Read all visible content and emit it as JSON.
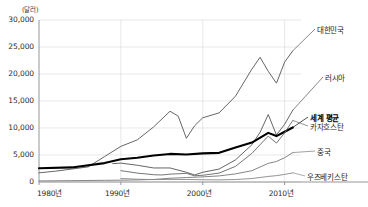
{
  "chart_data": {
    "type": "line",
    "title": "",
    "subtitle": "",
    "unit_label": "(달러)",
    "xlabel": "",
    "ylabel": "",
    "xlim": [
      1980,
      2012
    ],
    "ylim": [
      0,
      30000
    ],
    "grid": true,
    "legend_position": "right-inline",
    "x_ticks": [
      "1980년",
      "1990년",
      "2000년",
      "2010년"
    ],
    "x_tick_values": [
      1980,
      1990,
      2000,
      2010
    ],
    "y_ticks": [
      "0",
      "5,000",
      "10,000",
      "15,000",
      "20,000",
      "25,000",
      "30,000"
    ],
    "y_tick_values": [
      0,
      5000,
      10000,
      15000,
      20000,
      25000,
      30000
    ],
    "series": [
      {
        "name": "대한민국",
        "label": "대한민국",
        "emphasis": false,
        "color": "#555555",
        "width": 0.9,
        "x": [
          1980,
          1982,
          1984,
          1986,
          1988,
          1990,
          1992,
          1994,
          1996,
          1997,
          1998,
          1999,
          2000,
          2002,
          2004,
          2006,
          2007,
          2008,
          2009,
          2010,
          2011
        ],
        "values": [
          1700,
          2000,
          2400,
          2800,
          4700,
          6600,
          7800,
          10200,
          13100,
          12200,
          8100,
          10400,
          11900,
          12800,
          15900,
          20900,
          23100,
          20500,
          18300,
          22200,
          24300
        ]
      },
      {
        "name": "러시아",
        "label": "러시아",
        "emphasis": false,
        "color": "#555555",
        "width": 0.9,
        "x": [
          1989,
          1990,
          1992,
          1994,
          1996,
          1998,
          1999,
          2000,
          2002,
          2004,
          2006,
          2007,
          2008,
          2009,
          2010,
          2011
        ],
        "values": [
          3400,
          3500,
          3100,
          2600,
          2600,
          1800,
          1300,
          1800,
          2400,
          4100,
          6900,
          9200,
          12500,
          8700,
          10700,
          13300
        ]
      },
      {
        "name": "세계 평균",
        "label": "세계 평균",
        "emphasis": true,
        "color": "#000000",
        "width": 2.1,
        "x": [
          1980,
          1984,
          1988,
          1990,
          1992,
          1994,
          1996,
          1998,
          2000,
          2002,
          2004,
          2006,
          2008,
          2009,
          2010,
          2011
        ],
        "values": [
          2550,
          2700,
          3500,
          4200,
          4500,
          4900,
          5200,
          5100,
          5300,
          5400,
          6400,
          7300,
          9100,
          8500,
          9300,
          10100
        ]
      },
      {
        "name": "카자흐스탄",
        "label": "카자흐스탄",
        "emphasis": false,
        "color": "#666666",
        "width": 0.9,
        "x": [
          1990,
          1992,
          1994,
          1995,
          1996,
          1998,
          1999,
          2000,
          2002,
          2004,
          2006,
          2008,
          2009,
          2010,
          2011
        ],
        "values": [
          2100,
          1650,
          1350,
          1300,
          1450,
          1600,
          1150,
          1250,
          1650,
          2900,
          5300,
          8500,
          7200,
          9100,
          11400
        ]
      },
      {
        "name": "중국",
        "label": "중국",
        "emphasis": false,
        "color": "#777777",
        "width": 0.9,
        "x": [
          1980,
          1984,
          1988,
          1990,
          1992,
          1994,
          1996,
          1998,
          2000,
          2002,
          2004,
          2006,
          2008,
          2009,
          2010,
          2011
        ],
        "values": [
          200,
          250,
          310,
          340,
          380,
          470,
          700,
          820,
          950,
          1130,
          1500,
          2100,
          3450,
          3800,
          4500,
          5450
        ]
      },
      {
        "name": "우즈베키스탄",
        "label": "우즈베키스탄",
        "emphasis": false,
        "color": "#888888",
        "width": 0.9,
        "x": [
          1990,
          1992,
          1994,
          1996,
          1998,
          2000,
          2002,
          2004,
          2006,
          2008,
          2009,
          2010,
          2011
        ],
        "values": [
          650,
          520,
          440,
          480,
          470,
          420,
          390,
          460,
          640,
          1030,
          1180,
          1400,
          1700
        ]
      }
    ],
    "series_label_positions": [
      {
        "name": "대한민국",
        "x": 317,
        "y": 24
      },
      {
        "name": "러시아",
        "x": 325,
        "y": 72
      },
      {
        "name": "세계 평균",
        "x": 310,
        "y": 112
      },
      {
        "name": "카자흐스탄",
        "x": 310,
        "y": 121
      },
      {
        "name": "중국",
        "x": 317,
        "y": 146
      },
      {
        "name": "우즈베키스탄",
        "x": 307,
        "y": 171
      }
    ]
  },
  "axes": {
    "unit": "(달러)",
    "plot_left": 39,
    "plot_right": 301,
    "plot_top": 20,
    "plot_bottom": 182
  }
}
